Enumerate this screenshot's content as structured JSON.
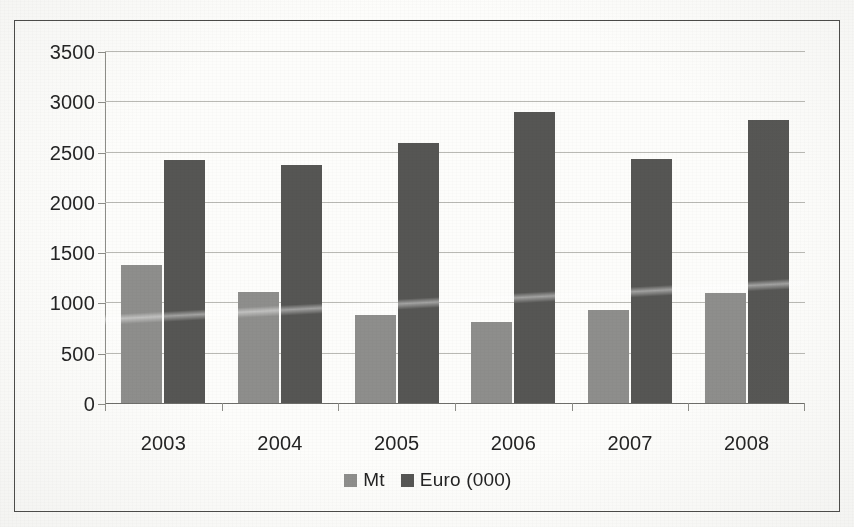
{
  "chart_data": {
    "type": "bar",
    "title": "",
    "xlabel": "",
    "ylabel": "",
    "categories": [
      "2003",
      "2004",
      "2005",
      "2006",
      "2007",
      "2008"
    ],
    "series": [
      {
        "name": "Mt",
        "color": "#8e8e8c",
        "values": [
          1370,
          1100,
          880,
          810,
          930,
          1090
        ]
      },
      {
        "name": "Euro (000)",
        "color": "#565654",
        "values": [
          2420,
          2370,
          2590,
          2890,
          2430,
          2810
        ]
      }
    ],
    "ylim": [
      0,
      3500
    ],
    "ytick_labels": [
      "3500",
      "3000",
      "2500",
      "2000",
      "1500",
      "1000",
      "500",
      "0"
    ],
    "ytick_values": [
      3500,
      3000,
      2500,
      2000,
      1500,
      1000,
      500,
      0
    ],
    "grid": true,
    "legend_position": "bottom-center"
  },
  "legend": {
    "items": [
      {
        "label": "Mt"
      },
      {
        "label": "Euro (000)"
      }
    ]
  }
}
